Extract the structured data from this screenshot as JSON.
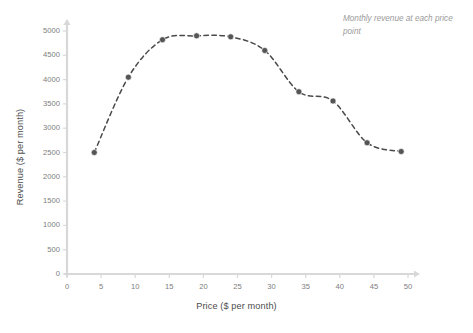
{
  "chart_data": {
    "type": "line",
    "title": "",
    "subtitle": "",
    "xlabel": "Price ($ per month)",
    "ylabel": "Revenue ($ per month)",
    "annotation": "Monthly revenue at each price point",
    "x": [
      4,
      9,
      14,
      19,
      24,
      29,
      34,
      39,
      44,
      49
    ],
    "values": [
      2500,
      4050,
      4820,
      4900,
      4880,
      4600,
      3750,
      3560,
      2700,
      2520
    ],
    "series": [
      {
        "name": "Revenue",
        "values": [
          2500,
          4050,
          4820,
          4900,
          4880,
          4600,
          3750,
          3560,
          2700,
          2520
        ]
      }
    ],
    "xlim": [
      0,
      50
    ],
    "ylim": [
      0,
      5000
    ],
    "xticks": [
      0,
      5,
      10,
      15,
      20,
      25,
      30,
      35,
      40,
      45,
      50
    ],
    "yticks": [
      0,
      500,
      1000,
      1500,
      2000,
      2500,
      3000,
      3500,
      4000,
      4500,
      5000
    ],
    "xtick_labels": [
      "0",
      "5",
      "10",
      "15",
      "20",
      "25",
      "30",
      "35",
      "40",
      "45",
      "50"
    ],
    "ytick_labels": [
      "0",
      "500",
      "1000",
      "1500",
      "2000",
      "2500",
      "3000",
      "3500",
      "4000",
      "4500",
      "5000"
    ],
    "grid": false,
    "legend": false,
    "legend_position": "none",
    "line_style": "dashed",
    "marker": "circle",
    "line_color": "#4a4a4a",
    "marker_color": "#555555",
    "axis_color": "#d8d8d8",
    "text_color": "#7d7d7d",
    "annotation_color": "#9a9a9a",
    "background_color": "#ffffff"
  }
}
